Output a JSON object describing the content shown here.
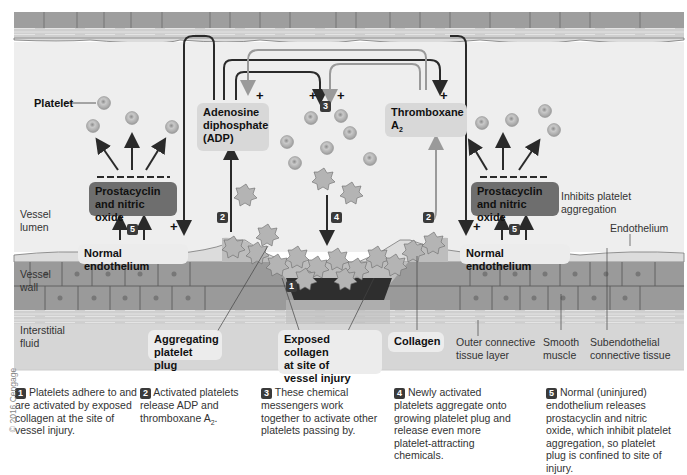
{
  "figure": {
    "regions": {
      "lumen": "Vessel\nlumen",
      "lumen_l1": "Vessel",
      "lumen_l2": "lumen",
      "wall_l1": "Vessel",
      "wall_l2": "wall",
      "interstitial_l1": "Interstitial",
      "interstitial_l2": "fluid"
    },
    "labels": {
      "platelet": "Platelet",
      "adp_l1": "Adenosine",
      "adp_l2": "diphosphate",
      "adp_l3": "(ADP)",
      "thromboxane_l1": "Thromboxane",
      "thromboxane_l2": "A",
      "thromboxane_sub": "2",
      "prostacyclin_l1": "Prostacyclin",
      "prostacyclin_l2": "and nitric oxide",
      "inhibits_l1": "Inhibits platelet",
      "inhibits_l2": "aggregation",
      "normal_endothelium": "Normal endothelium",
      "endothelium": "Endothelium",
      "aggregating_l1": "Aggregating",
      "aggregating_l2": "platelet plug",
      "exposed_l1": "Exposed collagen",
      "exposed_l2": "at site of",
      "exposed_l3": "vessel injury",
      "collagen": "Collagen",
      "outer_l1": "Outer connective",
      "outer_l2": "tissue layer",
      "smooth_l1": "Smooth",
      "smooth_l2": "muscle",
      "subendo_l1": "Subendothelial",
      "subendo_l2": "connective tissue",
      "plus": "+",
      "minus_row": "— — — — — —"
    },
    "step_markers": [
      "1",
      "2",
      "3",
      "4",
      "5"
    ],
    "captions": [
      {
        "num": "1",
        "text": "Platelets adhere to and are activated by exposed collagen at the site of vessel injury."
      },
      {
        "num": "2",
        "text": "Activated platelets release ADP and thromboxane A",
        "sub": "2",
        "tail": "."
      },
      {
        "num": "3",
        "text": "These chemical messengers work together to activate other platelets passing by."
      },
      {
        "num": "4",
        "text": "Newly activated platelets aggregate onto growing platelet plug and release even more platelet-attracting chemicals."
      },
      {
        "num": "5",
        "text": "Normal (uninjured) endothelium releases prostacyclin and nitric oxide, which inhibit platelet aggregation, so platelet plug is confined to site of injury."
      }
    ],
    "copyright": "© 2016 Cengage",
    "colors": {
      "lumen_bg": "#eeeeee",
      "wall_cells": "#9a9a9a",
      "connective": "#c8c8c8",
      "interstitial_bg": "#d6d6d6",
      "dark_box": "#6e6e6e",
      "light_box": "#d8d8d8",
      "arrow_dark": "#2a2a2a",
      "arrow_light": "#9a9a9a"
    }
  }
}
